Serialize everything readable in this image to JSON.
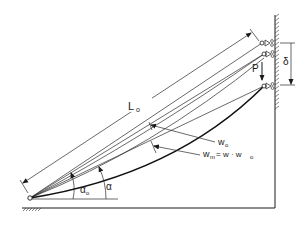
{
  "diagram": {
    "type": "structural-mechanics-schematic",
    "labels": {
      "length": "L",
      "length_sub": "o",
      "load": "P",
      "displacement": "δ",
      "initial_deflection": "w",
      "initial_deflection_sub": "o",
      "total_deflection_lhs": "w",
      "total_deflection_lhs_sub": "m",
      "total_deflection_eq": " = w · w",
      "total_deflection_rhs_sub": "o",
      "initial_angle": "α",
      "initial_angle_sub": "o",
      "final_angle": "α"
    },
    "colors": {
      "ink": "#1a1a1a",
      "background": "#ffffff"
    }
  }
}
